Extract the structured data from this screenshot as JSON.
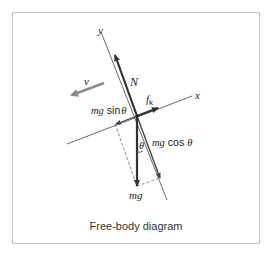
{
  "diagram": {
    "caption": "Free-body diagram",
    "axes": {
      "x_label": "x",
      "y_label": "y"
    },
    "forces": {
      "normal": {
        "label": "N"
      },
      "friction": {
        "label_main": "f",
        "label_sub": "k"
      },
      "weight": {
        "label": "mg"
      },
      "weight_parallel": {
        "label_italic": "mg",
        "label_fn": "sin",
        "label_angle": "θ"
      },
      "weight_perpendicular": {
        "label_italic": "mg",
        "label_fn": "cos",
        "label_angle": "θ"
      }
    },
    "velocity": {
      "label": "v"
    },
    "angle": {
      "label": "θ"
    },
    "colors": {
      "force": "#333333",
      "axis": "#444444",
      "velocity": "#8a8a8a",
      "frame": "#c8c8c8"
    }
  }
}
